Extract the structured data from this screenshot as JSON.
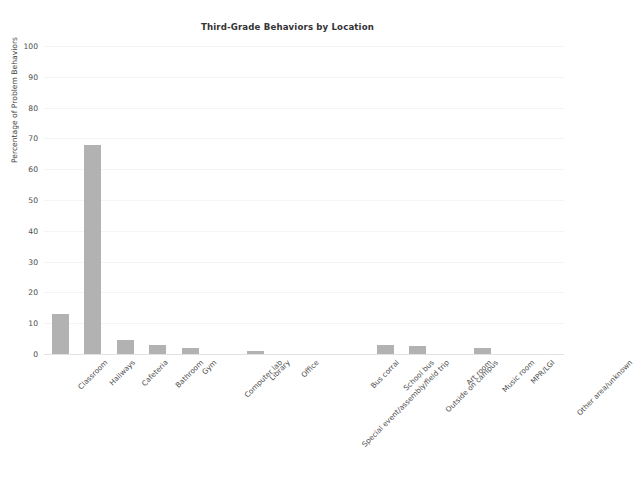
{
  "chart_data": {
    "type": "bar",
    "title": "Third-Grade Behaviors by Location",
    "xlabel": "",
    "ylabel": "Percentage of Problem Behaviors",
    "ylim": [
      0,
      100
    ],
    "ytick_labels": [
      "0",
      "10",
      "20",
      "30",
      "40",
      "50",
      "60",
      "70",
      "80",
      "90",
      "100"
    ],
    "ytick_values": [
      0,
      10,
      20,
      30,
      40,
      50,
      60,
      70,
      80,
      90,
      100
    ],
    "grid": true,
    "legend": "none",
    "bar_color": "#b2b2b2",
    "background_color": "#ffffff",
    "categories": [
      "Classroom",
      "Hallways",
      "Cafeteria",
      "Bathroom",
      "Gym",
      "Computer lab",
      "Library",
      "Office",
      "Special event/assembly/field trip",
      "Bus corral",
      "School bus",
      "Outside on campus",
      "Art room",
      "Music room",
      "MPR/LGI",
      "Other area/unknown"
    ],
    "values": [
      13,
      68,
      4.5,
      3,
      2,
      0,
      1,
      0,
      0,
      0,
      3,
      2.5,
      0,
      2,
      0,
      0
    ]
  }
}
